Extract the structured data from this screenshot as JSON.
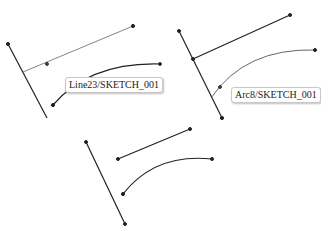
{
  "scene": {
    "panels": [
      {
        "name": "before",
        "tooltip": "Line23/SKETCH_001"
      },
      {
        "name": "selected",
        "tooltip": "Arc8/SKETCH_001"
      },
      {
        "name": "after"
      }
    ]
  },
  "colors": {
    "line": "#222222",
    "highlight": "#555555"
  }
}
